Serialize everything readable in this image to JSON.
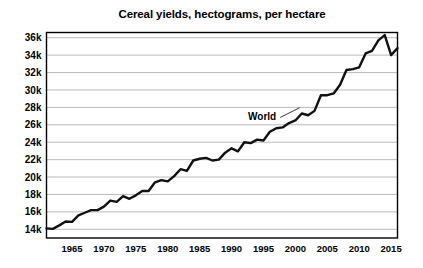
{
  "chart_data": {
    "type": "line",
    "title": "Cereal yields, hectograms, per hectare",
    "xlabel": "",
    "ylabel": "",
    "xlim": [
      1961,
      2016
    ],
    "ylim": [
      13000,
      36600
    ],
    "grid": true,
    "legend_position": "inline-annotation",
    "yticks": [
      14000,
      16000,
      18000,
      20000,
      22000,
      24000,
      26000,
      28000,
      30000,
      32000,
      34000,
      36000
    ],
    "ytick_labels": [
      "14k",
      "16k",
      "18k",
      "20k",
      "22k",
      "24k",
      "26k",
      "28k",
      "30k",
      "32k",
      "34k",
      "36k"
    ],
    "xticks": [
      1965,
      1970,
      1975,
      1980,
      1985,
      1990,
      1995,
      2000,
      2005,
      2010,
      2015
    ],
    "xtick_labels": [
      "1965",
      "1970",
      "1975",
      "1980",
      "1985",
      "1990",
      "1995",
      "2000",
      "2005",
      "2010",
      "2015"
    ],
    "annotations": [
      {
        "text": "World",
        "x": 1997,
        "y": 26500,
        "points_to_x": 2001,
        "points_to_y": 28200
      }
    ],
    "series": [
      {
        "name": "World",
        "color": "#111111",
        "x": [
          1961,
          1962,
          1963,
          1964,
          1965,
          1966,
          1967,
          1968,
          1969,
          1970,
          1971,
          1972,
          1973,
          1974,
          1975,
          1976,
          1977,
          1978,
          1979,
          1980,
          1981,
          1982,
          1983,
          1984,
          1985,
          1986,
          1987,
          1988,
          1989,
          1990,
          1991,
          1992,
          1993,
          1994,
          1995,
          1996,
          1997,
          1998,
          1999,
          2000,
          2001,
          2002,
          2003,
          2004,
          2005,
          2006,
          2007,
          2008,
          2009,
          2010,
          2011,
          2012,
          2013,
          2014,
          2015
        ],
        "values": [
          14100,
          14050,
          14450,
          14900,
          14850,
          15600,
          15900,
          16200,
          16200,
          16600,
          17300,
          17150,
          17800,
          17500,
          17900,
          18400,
          18400,
          19400,
          19650,
          19500,
          20100,
          20900,
          20700,
          21900,
          22100,
          22200,
          21900,
          22000,
          22800,
          23300,
          22950,
          24000,
          23900,
          24300,
          24200,
          25200,
          25600,
          25700,
          26200,
          26500,
          27300,
          27100,
          27600,
          29400,
          29400,
          29600,
          30600,
          32300,
          32400,
          32600,
          34200,
          34500,
          35700,
          36300,
          34000
        ]
      }
    ]
  },
  "series_end_note": {
    "final_rebound_value": 34800
  }
}
